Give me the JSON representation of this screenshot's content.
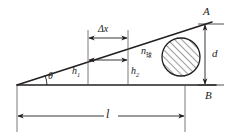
{
  "figure": {
    "type": "mechanics-diagram",
    "background_color": "#ffffff",
    "line_color": "#231f20"
  },
  "labels": {
    "point_a": "A",
    "point_b": "B",
    "angle_theta": "θ",
    "delta_x": "Δx",
    "height_1_base": "h",
    "height_1_sub": "1",
    "height_2_base": "h",
    "height_2_sub": "2",
    "diameter_d": "d",
    "length_l": "l",
    "body_index_base": "n",
    "body_index_sub": "球"
  },
  "geometry": {
    "apex_x": 17,
    "apex_y": 85,
    "baseline_y": 85,
    "baseline_x_end": 216,
    "incline_x_end": 212,
    "incline_y_end": 22,
    "circle_cx": 181,
    "circle_cy": 57,
    "circle_r": 19,
    "vline_1_x": 88,
    "vline_2_x": 128,
    "dim_deltax_y": 38,
    "dim_inner_y": 60,
    "dim_d_x": 205,
    "dim_l_y": 116,
    "dim_l_x1": 17,
    "dim_l_x2": 185
  }
}
